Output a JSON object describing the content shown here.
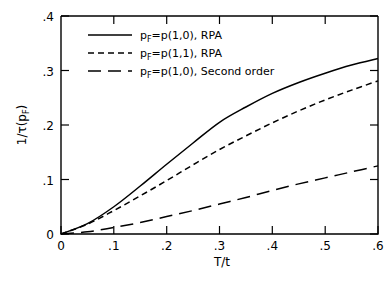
{
  "figure": {
    "background_color": "#ffffff",
    "line_color": "#000000"
  },
  "chart_data": {
    "type": "line",
    "title": "",
    "subtitle": "",
    "xlabel": "T/t",
    "ylabel": "1/τ(p_F)",
    "xlabel_parts": {
      "numerator": "T",
      "slash": "/",
      "denominator": "t"
    },
    "ylabel_parts": {
      "prefix": "1/τ(p",
      "subscript": "F",
      "suffix": ")"
    },
    "xlim": [
      0,
      0.6
    ],
    "ylim": [
      0,
      0.4
    ],
    "grid": false,
    "legend_position": "upper-left-inside",
    "xticks": [
      0,
      0.1,
      0.2,
      0.3,
      0.4,
      0.5,
      0.6
    ],
    "xticklabels": [
      "0",
      ".1",
      ".2",
      ".3",
      ".4",
      ".5",
      ".6"
    ],
    "yticks": [
      0,
      0.1,
      0.2,
      0.3,
      0.4
    ],
    "yticklabels": [
      "0",
      ".1",
      ".2",
      ".3",
      ".4"
    ],
    "x": [
      0,
      0.05,
      0.1,
      0.15,
      0.2,
      0.25,
      0.3,
      0.35,
      0.4,
      0.45,
      0.5,
      0.55,
      0.6
    ],
    "series": [
      {
        "name": "p_F=p(1,0), RPA",
        "label_parts": {
          "p": "p",
          "sub": "F",
          "rest": "=p(1,0), RPA"
        },
        "linestyle": "solid",
        "color": "#000000",
        "values": [
          0,
          0.019,
          0.05,
          0.088,
          0.128,
          0.167,
          0.205,
          0.233,
          0.258,
          0.278,
          0.295,
          0.31,
          0.322
        ]
      },
      {
        "name": "p_F=p(1,1), RPA",
        "label_parts": {
          "p": "p",
          "sub": "F",
          "rest": "=p(1,1), RPA"
        },
        "linestyle": "dashed-short",
        "color": "#000000",
        "values": [
          0,
          0.018,
          0.043,
          0.07,
          0.098,
          0.127,
          0.155,
          0.18,
          0.204,
          0.226,
          0.246,
          0.264,
          0.281
        ]
      },
      {
        "name": "p_F=p(1,0), Second order",
        "label_parts": {
          "p": "p",
          "sub": "F",
          "rest": "=p(1,0), Second order"
        },
        "linestyle": "dashed-long",
        "color": "#000000",
        "values": [
          0,
          0.004,
          0.012,
          0.021,
          0.032,
          0.043,
          0.055,
          0.067,
          0.08,
          0.092,
          0.103,
          0.114,
          0.125
        ]
      }
    ]
  }
}
